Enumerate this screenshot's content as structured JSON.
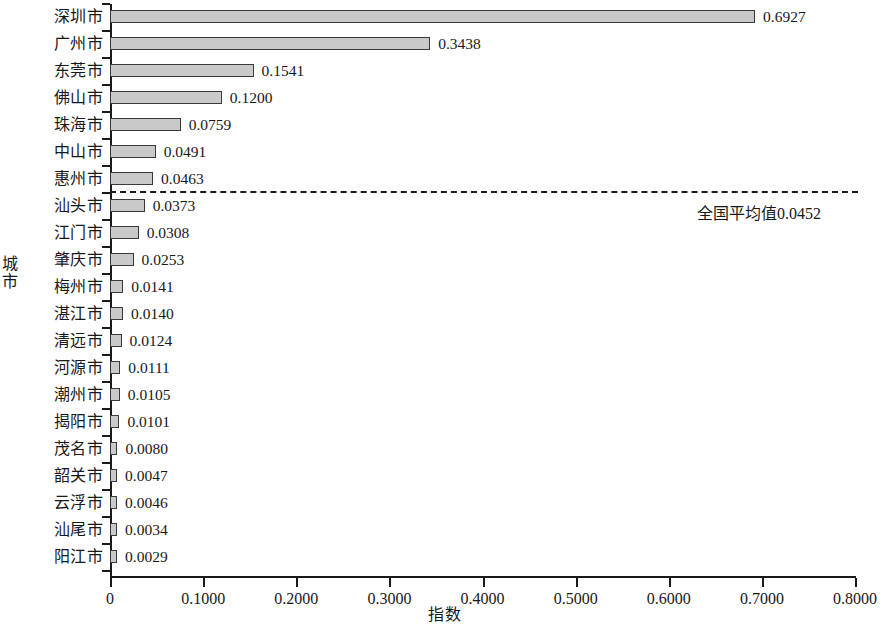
{
  "chart_data": {
    "type": "bar",
    "orientation": "horizontal",
    "title": "",
    "xlabel": "指数",
    "ylabel": "城市",
    "xlim": [
      0,
      0.8
    ],
    "grid": false,
    "legend": null,
    "xticks": [
      "0",
      "0.1000",
      "0.2000",
      "0.3000",
      "0.4000",
      "0.5000",
      "0.6000",
      "0.7000",
      "0.8000"
    ],
    "xtick_values": [
      0,
      0.1,
      0.2,
      0.3,
      0.4,
      0.5,
      0.6,
      0.7,
      0.8
    ],
    "categories": [
      "深圳市",
      "广州市",
      "东莞市",
      "佛山市",
      "珠海市",
      "中山市",
      "惠州市",
      "汕头市",
      "江门市",
      "肇庆市",
      "梅州市",
      "湛江市",
      "清远市",
      "河源市",
      "潮州市",
      "揭阳市",
      "茂名市",
      "韶关市",
      "云浮市",
      "汕尾市",
      "阳江市"
    ],
    "values": [
      0.6927,
      0.3438,
      0.1541,
      0.12,
      0.0759,
      0.0491,
      0.0463,
      0.0373,
      0.0308,
      0.0253,
      0.0141,
      0.014,
      0.0124,
      0.0111,
      0.0105,
      0.0101,
      0.008,
      0.0047,
      0.0046,
      0.0034,
      0.0029
    ],
    "value_labels": [
      "0.6927",
      "0.3438",
      "0.1541",
      "0.1200",
      "0.0759",
      "0.0491",
      "0.0463",
      "0.0373",
      "0.0308",
      "0.0253",
      "0.0141",
      "0.0140",
      "0.0124",
      "0.0111",
      "0.0105",
      "0.0101",
      "0.0080",
      "0.0047",
      "0.0046",
      "0.0034",
      "0.0029"
    ],
    "annotations": [
      {
        "name": "national-average-line",
        "text": "全国平均值0.0452",
        "value": 0.0452,
        "style": "dashed-horizontal-line",
        "after_category": "惠州市"
      }
    ],
    "colors": {
      "bar_fill": "#c9c9c9",
      "bar_stroke": "#3a3a3a",
      "axis": "#1a1a1a",
      "text": "#181818"
    }
  }
}
